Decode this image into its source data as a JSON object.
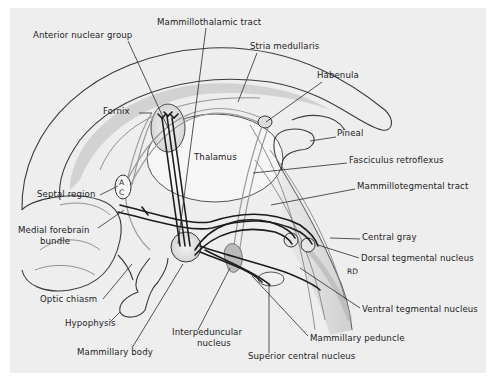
{
  "figure": {
    "background": "#eeeeee",
    "panel": {
      "x": 10,
      "y": 8,
      "w": 476,
      "h": 365
    }
  },
  "labels": [
    {
      "id": "mammillothalamic-tract",
      "text": "Mammillothalamic tract",
      "x": 157,
      "y": 25,
      "anchor": "start",
      "leader": [
        [
          206,
          28
        ],
        [
          178,
          244
        ]
      ]
    },
    {
      "id": "anterior-nuclear-group",
      "text": "Anterior nuclear group",
      "x": 33,
      "y": 38,
      "anchor": "start",
      "leader": [
        [
          128,
          41
        ],
        [
          168,
          128
        ]
      ]
    },
    {
      "id": "stria-medullaris",
      "text": "Stria medullaris",
      "x": 250,
      "y": 49,
      "anchor": "start",
      "leader": [
        [
          257,
          53
        ],
        [
          238,
          102
        ]
      ]
    },
    {
      "id": "fornix",
      "text": "Fornix",
      "x": 103,
      "y": 114,
      "anchor": "start",
      "leader": [
        [
          139,
          113
        ],
        [
          152,
          113
        ]
      ]
    },
    {
      "id": "habenula",
      "text": "Habenula",
      "x": 317,
      "y": 78,
      "anchor": "start",
      "leader": [
        [
          322,
          82
        ],
        [
          266,
          122
        ]
      ]
    },
    {
      "id": "pineal",
      "text": "Pineal",
      "x": 337,
      "y": 136,
      "anchor": "start",
      "leader": [
        [
          336,
          137
        ],
        [
          310,
          141
        ]
      ]
    },
    {
      "id": "thalamus",
      "text": "Thalamus",
      "x": 194,
      "y": 160,
      "anchor": "start",
      "leader": null
    },
    {
      "id": "fasciculus-retroflexus",
      "text": "Fasciculus retroflexus",
      "x": 349,
      "y": 163,
      "anchor": "start",
      "leader": [
        [
          347,
          163
        ],
        [
          253,
          173
        ]
      ]
    },
    {
      "id": "mammillotegmental-tract",
      "text": "Mammillotegmental tract",
      "x": 357,
      "y": 189,
      "anchor": "start",
      "leader": [
        [
          355,
          189
        ],
        [
          271,
          205
        ]
      ]
    },
    {
      "id": "septal-region",
      "text": "Septal region",
      "x": 37,
      "y": 197,
      "anchor": "start",
      "leader": [
        [
          100,
          195
        ],
        [
          118,
          186
        ]
      ]
    },
    {
      "id": "medial-forebrain-bundle",
      "text": "Medial forebrain",
      "text2": "bundle",
      "x": 18,
      "y": 233,
      "anchor": "start",
      "leader": [
        [
          98,
          228
        ],
        [
          124,
          210
        ]
      ]
    },
    {
      "id": "central-gray",
      "text": "Central gray",
      "x": 362,
      "y": 240,
      "anchor": "start",
      "leader": [
        [
          360,
          239
        ],
        [
          330,
          238
        ]
      ]
    },
    {
      "id": "dorsal-tegmental-nucleus",
      "text": "Dorsal tegmental nucleus",
      "x": 361,
      "y": 261,
      "anchor": "start",
      "leader": [
        [
          359,
          258
        ],
        [
          318,
          245
        ]
      ]
    },
    {
      "id": "rd",
      "text": "RD",
      "x": 347,
      "y": 274,
      "anchor": "start",
      "leader": null
    },
    {
      "id": "optic-chiasm",
      "text": "Optic chiasm",
      "x": 40,
      "y": 302,
      "anchor": "start",
      "leader": [
        [
          103,
          299
        ],
        [
          132,
          264
        ]
      ]
    },
    {
      "id": "ventral-tegmental-nucleus",
      "text": "Ventral tegmental nucleus",
      "x": 362,
      "y": 312,
      "anchor": "start",
      "leader": [
        [
          360,
          308
        ],
        [
          300,
          268
        ]
      ]
    },
    {
      "id": "hypophysis",
      "text": "Hypophysis",
      "x": 65,
      "y": 326,
      "anchor": "start",
      "leader": [
        [
          110,
          322
        ],
        [
          120,
          312
        ]
      ]
    },
    {
      "id": "interpeduncular-nucleus",
      "text": "Interpeduncular",
      "text2": "nucleus",
      "x": 172,
      "y": 335,
      "anchor": "start",
      "leader": [
        [
          198,
          330
        ],
        [
          230,
          268
        ]
      ]
    },
    {
      "id": "mammillary-peduncle",
      "text": "Mammillary peduncle",
      "x": 310,
      "y": 341,
      "anchor": "start",
      "leader": [
        [
          308,
          336
        ],
        [
          252,
          276
        ]
      ]
    },
    {
      "id": "mammillary-body",
      "text": "Mammillary body",
      "x": 77,
      "y": 355,
      "anchor": "start",
      "leader": [
        [
          132,
          348
        ],
        [
          183,
          264
        ]
      ]
    },
    {
      "id": "superior-central-nucleus",
      "text": "Superior central nucleus",
      "x": 248,
      "y": 359,
      "anchor": "start",
      "leader": [
        [
          269,
          353
        ],
        [
          269,
          283
        ]
      ]
    }
  ],
  "structure_marks": {
    "ac_letters": [
      "A",
      "C"
    ]
  }
}
